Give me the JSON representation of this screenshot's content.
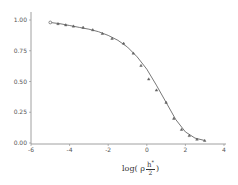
{
  "chart_data": {
    "type": "line",
    "title": "",
    "xlabel": "log( ρ h*/2 )",
    "ylabel": "",
    "xlim": [
      -6,
      4
    ],
    "ylim": [
      0,
      1.0
    ],
    "x_ticks": [
      -6,
      -4,
      -2,
      0,
      2,
      4
    ],
    "x_tick_labels": [
      "-6",
      "-4",
      "-2",
      "0",
      "2",
      "4"
    ],
    "y_ticks": [
      0,
      0.25,
      0.5,
      0.75,
      1.0
    ],
    "y_tick_labels": [
      "0.00",
      "0.25",
      "0.50",
      "0.75",
      "1.00"
    ],
    "grid": false,
    "legend": null,
    "series": [
      {
        "name": "data points",
        "style": "markers",
        "x": [
          -5.0,
          -4.6,
          -4.2,
          -3.8,
          -3.3,
          -2.8,
          -2.3,
          -1.8,
          -1.2,
          -0.7,
          -0.3,
          0.1,
          0.5,
          1.0,
          1.4,
          1.8,
          2.2,
          2.6,
          3.0
        ],
        "values": [
          0.98,
          0.97,
          0.96,
          0.95,
          0.94,
          0.92,
          0.89,
          0.85,
          0.81,
          0.73,
          0.63,
          0.52,
          0.43,
          0.33,
          0.2,
          0.11,
          0.06,
          0.03,
          0.02
        ]
      },
      {
        "name": "fitted curve",
        "style": "line",
        "x": [
          -5.0,
          -4.5,
          -4.0,
          -3.5,
          -3.0,
          -2.5,
          -2.0,
          -1.5,
          -1.0,
          -0.5,
          0.0,
          0.5,
          1.0,
          1.5,
          2.0,
          2.5,
          3.0
        ],
        "values": [
          0.98,
          0.97,
          0.955,
          0.94,
          0.925,
          0.905,
          0.875,
          0.835,
          0.78,
          0.7,
          0.6,
          0.47,
          0.33,
          0.19,
          0.09,
          0.04,
          0.02
        ]
      }
    ]
  },
  "axis": {
    "xlabel_prefix": "log( ρ",
    "xlabel_num": "h",
    "xlabel_sup": "*",
    "xlabel_den": "2",
    "xlabel_suffix": ")"
  }
}
